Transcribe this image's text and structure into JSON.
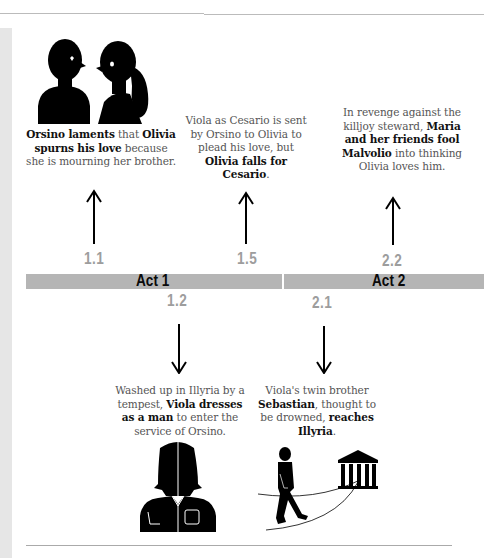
{
  "timeline": {
    "acts": [
      {
        "label": "Act 1",
        "color": "#b5b5b5"
      },
      {
        "label": "Act 2",
        "color": "#b5b5b5"
      }
    ],
    "scenes": [
      {
        "number": "1.1",
        "direction": "up",
        "illustration": "orsino-olivia-silhouettes",
        "caption": [
          {
            "text": "Orsino laments",
            "bold": true
          },
          {
            "text": " that ",
            "bold": false
          },
          {
            "text": "Olivia spurns his love",
            "bold": true
          },
          {
            "text": " because she is mourning her brother.",
            "bold": false
          }
        ]
      },
      {
        "number": "1.5",
        "direction": "up",
        "caption": [
          {
            "text": "Viola as Cesario is sent by Orsino to Olivia to plead his love, but ",
            "bold": false
          },
          {
            "text": "Olivia falls for Cesario",
            "bold": true
          },
          {
            "text": ".",
            "bold": false
          }
        ]
      },
      {
        "number": "2.2",
        "direction": "up",
        "caption": [
          {
            "text": "In revenge against the killjoy steward, ",
            "bold": false
          },
          {
            "text": "Maria and her friends fool Malvolio",
            "bold": true
          },
          {
            "text": " into thinking Olivia loves him.",
            "bold": false
          }
        ]
      },
      {
        "number": "1.2",
        "direction": "down",
        "illustration": "viola-disguised-figure",
        "caption": [
          {
            "text": "Washed up in Illyria by a tempest, ",
            "bold": false
          },
          {
            "text": "Viola dresses as a man",
            "bold": true
          },
          {
            "text": " to enter the service of Orsino.",
            "bold": false
          }
        ]
      },
      {
        "number": "2.1",
        "direction": "down",
        "illustration": "sebastian-walking-to-temple",
        "caption": [
          {
            "text": "Viola's twin brother ",
            "bold": false
          },
          {
            "text": "Sebastian",
            "bold": true
          },
          {
            "text": ", thought to be drowned, ",
            "bold": false
          },
          {
            "text": "reaches Illyria",
            "bold": true
          },
          {
            "text": ".",
            "bold": false
          }
        ]
      }
    ]
  }
}
